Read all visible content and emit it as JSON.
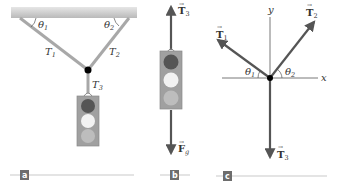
{
  "figure": {
    "panels": [
      {
        "id": "a",
        "label": "a",
        "description": "Traffic light suspended from ceiling by two cables meeting at a knot, third cable to light",
        "labels": {
          "theta1": "θ",
          "theta1_sub": "1",
          "theta2": "θ",
          "theta2_sub": "2",
          "T1": "T",
          "T1_sub": "1",
          "T2": "T",
          "T2_sub": "2",
          "T3": "T",
          "T3_sub": "3"
        }
      },
      {
        "id": "b",
        "label": "b",
        "description": "Free-body diagram of traffic light",
        "labels": {
          "T3": "T",
          "T3_sub": "3",
          "Fg": "F",
          "Fg_sub": "g"
        }
      },
      {
        "id": "c",
        "label": "c",
        "description": "Free-body diagram of knot",
        "labels": {
          "T1": "T",
          "T1_sub": "1",
          "T2": "T",
          "T2_sub": "2",
          "T3": "T",
          "T3_sub": "3",
          "theta1": "θ",
          "theta1_sub": "1",
          "theta2": "θ",
          "theta2_sub": "2",
          "x_axis": "x",
          "y_axis": "y"
        }
      }
    ],
    "colors": {
      "ceiling": "#c8c8c8",
      "cable": "#a8a8a8",
      "arrow": "#555555",
      "knot": "#000000",
      "light_housing": "#a0a0a0",
      "red_lamp": "#555555",
      "white_lamp": "#f2f2f2",
      "gray_lamp": "#bdbdbd",
      "tag_bg": "#6d6d6d",
      "rule": "#bbbbbb"
    }
  }
}
